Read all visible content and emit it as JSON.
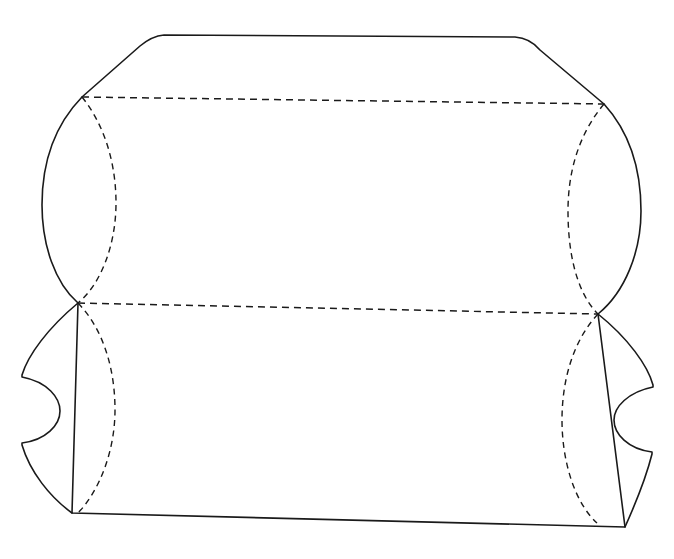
{
  "figure": {
    "title": "Pillow box dieline",
    "canvas": {
      "width": 674,
      "height": 559,
      "background": "#ffffff"
    },
    "style": {
      "cut_line_color": "#1a1a1a",
      "fold_line_color": "#1a1a1a",
      "cut_line_width": 1.6,
      "fold_line_width": 1.5,
      "fold_dash_pattern": "7 5"
    }
  },
  "geometry": {
    "vertices": {
      "top_left_fold_junction": {
        "x": 82,
        "y": 97
      },
      "top_right_fold_junction": {
        "x": 604,
        "y": 104
      },
      "mid_left_junction": {
        "x": 78,
        "y": 303
      },
      "mid_right_junction": {
        "x": 598,
        "y": 314
      },
      "bottom_left_corner": {
        "x": 72,
        "y": 513
      },
      "bottom_right_corner": {
        "x": 625,
        "y": 527
      },
      "top_edge_left_round_start": {
        "x": 140,
        "y": 46
      },
      "top_edge_left_round_end": {
        "x": 164,
        "y": 35
      },
      "top_edge_right_round_start": {
        "x": 515,
        "y": 37
      },
      "top_edge_right_round_end": {
        "x": 540,
        "y": 50
      },
      "left_arc_extreme": {
        "x": 42,
        "y": 205
      },
      "right_arc_extreme": {
        "x": 641,
        "y": 211
      },
      "left_lower_arc_extreme": {
        "x": 23,
        "y": 410
      },
      "right_lower_arc_extreme": {
        "x": 652,
        "y": 418
      }
    },
    "notches": {
      "left_notch": {
        "center_x": 27,
        "center_y": 408,
        "radius": 33,
        "bulge": "right"
      },
      "right_notch": {
        "center_x": 648,
        "center_y": 416,
        "radius": 33,
        "bulge": "left"
      }
    }
  },
  "paths": {
    "top_flap_cut": "M 82 97 L 140 46 Q 152 36 164 35 L 515 37 Q 530 38 540 50 L 604 104",
    "bottom_flap_cut": "M 78 303 L 72 513 L 625 527 L 598 314",
    "left_outer_cut_upper": "M 82 97 C 50 130 42 170 42 205 C 42 245 55 283 78 303",
    "right_outer_cut_upper": "M 604 104 C 634 137 641 176 641 211 C 641 252 625 292 598 314",
    "left_outer_cut_lower": "M 78 303 C 48 328 28 355 22 375 L 22 377 C 48 382 60 398 60 411 C 60 425 46 440 22 443 L 22 445 C 30 472 50 497 72 513",
    "right_outer_cut_lower": "M 598 314 C 628 338 648 366 653 385 L 653 387 C 628 392 614 407 614 420 C 614 434 628 449 652 452 L 652 454 C 645 482 634 507 625 527",
    "left_fold_arc": "M 82 97 C 106 127 116 166 116 203 C 116 243 102 283 78 303",
    "right_fold_arc": "M 604 104 C 578 135 568 173 568 211 C 568 252 576 292 598 314",
    "left_fold_arc_lower": "M 78 303 C 104 330 115 370 115 410 C 115 450 100 490 78 513",
    "right_fold_arc_lower": "M 598 314 C 572 342 562 382 562 420 C 562 462 575 503 597 523",
    "upper_fold_line": "M 82 97 L 604 104",
    "middle_fold_line": "M 78 303 L 598 314"
  },
  "elements": [
    {
      "name": "top-closure-flap",
      "type": "panel",
      "line_type": "cut"
    },
    {
      "name": "upper-body-panel",
      "type": "panel",
      "line_type": "cut"
    },
    {
      "name": "lower-body-panel",
      "type": "panel",
      "line_type": "cut"
    },
    {
      "name": "left-end-curve",
      "type": "edge",
      "line_type": "cut"
    },
    {
      "name": "right-end-curve",
      "type": "edge",
      "line_type": "cut"
    },
    {
      "name": "left-thumb-notch",
      "type": "notch",
      "line_type": "cut"
    },
    {
      "name": "right-thumb-notch",
      "type": "notch",
      "line_type": "cut"
    },
    {
      "name": "upper-fold-crease",
      "type": "crease",
      "line_type": "fold"
    },
    {
      "name": "middle-fold-crease",
      "type": "crease",
      "line_type": "fold"
    },
    {
      "name": "left-curved-crease-upper",
      "type": "crease",
      "line_type": "fold"
    },
    {
      "name": "left-curved-crease-lower",
      "type": "crease",
      "line_type": "fold"
    },
    {
      "name": "right-curved-crease-upper",
      "type": "crease",
      "line_type": "fold"
    },
    {
      "name": "right-curved-crease-lower",
      "type": "crease",
      "line_type": "fold"
    }
  ]
}
